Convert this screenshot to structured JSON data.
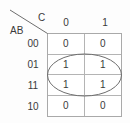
{
  "diagram": {
    "type": "karnaugh-map",
    "corner": {
      "column_variable": "C",
      "row_variable": "AB"
    },
    "column_headers": [
      "0",
      "1"
    ],
    "row_headers": [
      "00",
      "01",
      "11",
      "10"
    ],
    "cells": [
      [
        "0",
        "0"
      ],
      [
        "1",
        "1"
      ],
      [
        "1",
        "1"
      ],
      [
        "0",
        "0"
      ]
    ],
    "groups": [
      {
        "shape": "ellipse",
        "covers_rows": [
          "01",
          "11"
        ],
        "covers_columns": [
          "0",
          "1"
        ],
        "value": "1"
      }
    ],
    "colors": {
      "grid_line": "#b4b4b4",
      "border": "#a9a9a9",
      "text": "#3a3a3a",
      "group_outline": "#6e6e6e",
      "background": "#fdfdfd"
    }
  }
}
